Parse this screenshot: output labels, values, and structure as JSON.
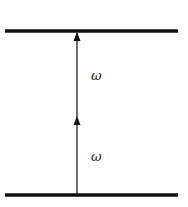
{
  "diagram": {
    "type": "parallel-lines-with-vertical-arrow",
    "top_line": {
      "x1": 5,
      "x2": 178,
      "y": 31
    },
    "bottom_line": {
      "x1": 5,
      "x2": 178,
      "y": 195
    },
    "vertical_line": {
      "x": 77,
      "y_top": 31,
      "y_bottom": 195
    },
    "arrowheads": [
      {
        "x": 77,
        "y": 31,
        "direction": "up"
      },
      {
        "x": 77,
        "y": 116,
        "direction": "up"
      }
    ],
    "labels": [
      {
        "text": "ω",
        "x": 91,
        "y": 80
      },
      {
        "text": "ω",
        "x": 91,
        "y": 161
      }
    ],
    "colors": {
      "stroke": "#111111",
      "background": "#ffffff"
    }
  }
}
